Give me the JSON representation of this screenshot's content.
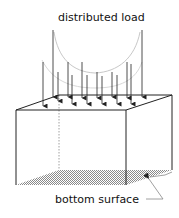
{
  "diagram": {
    "title_label": "distributed load",
    "bottom_label": "bottom surface",
    "load_arrow_count": 15,
    "colors": {
      "stroke": "#222222",
      "load_curve": "#c8c8c8",
      "bottom_fill": "#9a9a9a",
      "hidden_edge": "#888888"
    }
  }
}
